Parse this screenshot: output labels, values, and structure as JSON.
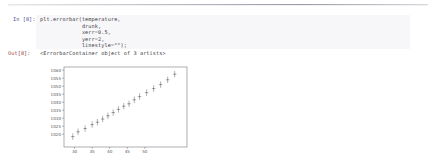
{
  "notebook": {
    "in_prompt": "In [8]:",
    "out_prompt": "Out[8]:",
    "code": "plt.errorbar(temperature,\n             drunk,\n             xerr=0.5,\n             yerr=2,\n             linestyle=\"\");",
    "output_text": "<ErrorbarContainer object of 3 artists>"
  },
  "colors": {
    "in_prompt": "#4a4a8a",
    "out_prompt": "#9a3a3a",
    "code_bg": "#f7f7f9",
    "marker": "#6e6e76",
    "axis": "#7a7a82",
    "page_bg": "#ffffff"
  },
  "chart_data": {
    "type": "scatter",
    "title": "",
    "xlabel": "",
    "ylabel": "",
    "xlim": [
      27,
      62
    ],
    "ylim": [
      1012,
      1062
    ],
    "xticks": [
      30,
      35,
      40,
      45,
      50
    ],
    "xtick_labels": [
      "30",
      "35",
      "40",
      "45",
      "50"
    ],
    "yticks": [
      1020,
      1025,
      1030,
      1035,
      1040,
      1045,
      1050,
      1055,
      1060
    ],
    "ytick_labels": [
      "1020",
      "1025",
      "1030",
      "1035",
      "1040",
      "1045",
      "1050",
      "1055",
      "1060"
    ],
    "grid": false,
    "xerr": 0.5,
    "yerr": 2,
    "linestyle": "none",
    "x": [
      29.5,
      31.0,
      33.0,
      35.0,
      36.5,
      38.0,
      39.5,
      41.0,
      42.5,
      44.0,
      45.5,
      47.0,
      48.5,
      50.5,
      52.5,
      54.5,
      56.5,
      58.5
    ],
    "y": [
      1018.5,
      1021.5,
      1023.5,
      1026.0,
      1027.5,
      1029.5,
      1031.5,
      1033.5,
      1035.5,
      1037.5,
      1039.0,
      1041.5,
      1043.5,
      1046.0,
      1048.5,
      1051.0,
      1054.0,
      1057.5
    ]
  }
}
